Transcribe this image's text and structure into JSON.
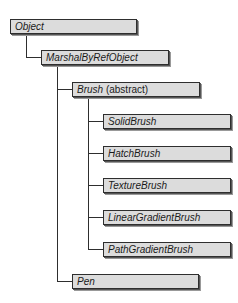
{
  "diagram": {
    "type": "class-hierarchy",
    "nodes": [
      {
        "id": "object",
        "label": "Object"
      },
      {
        "id": "marshal",
        "label": "MarshalByRefObject"
      },
      {
        "id": "brush",
        "label": "Brush",
        "qualifier": "(abstract)"
      },
      {
        "id": "solid",
        "label": "SolidBrush"
      },
      {
        "id": "hatch",
        "label": "HatchBrush"
      },
      {
        "id": "texture",
        "label": "TextureBrush"
      },
      {
        "id": "linear",
        "label": "LinearGradientBrush"
      },
      {
        "id": "path",
        "label": "PathGradientBrush"
      },
      {
        "id": "pen",
        "label": "Pen"
      }
    ],
    "edges": [
      [
        "object",
        "marshal"
      ],
      [
        "marshal",
        "brush"
      ],
      [
        "marshal",
        "pen"
      ],
      [
        "brush",
        "solid"
      ],
      [
        "brush",
        "hatch"
      ],
      [
        "brush",
        "texture"
      ],
      [
        "brush",
        "linear"
      ],
      [
        "brush",
        "path"
      ]
    ],
    "colors": {
      "box_fill": "#dcdcdc",
      "border": "#2e2e2e",
      "shadow": "#999999"
    }
  }
}
